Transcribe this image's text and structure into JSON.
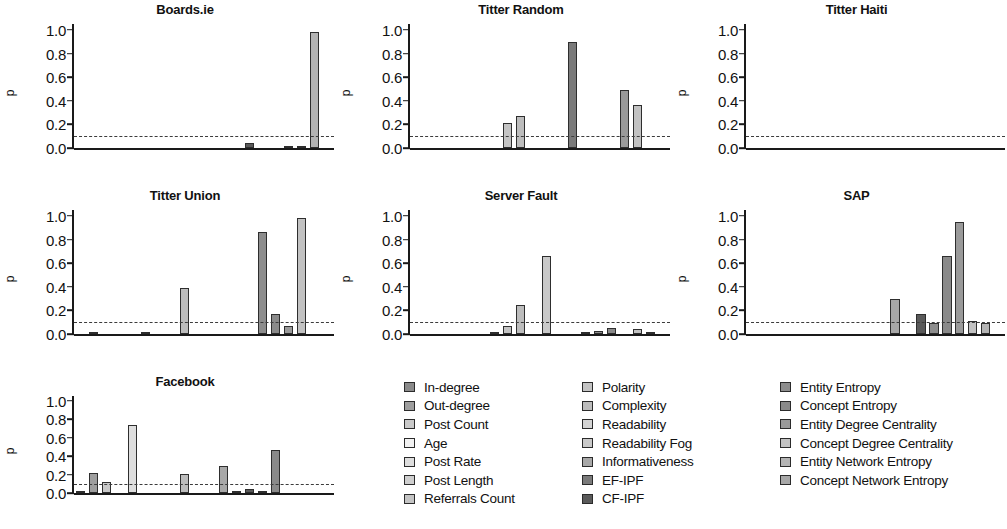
{
  "axis": {
    "ylabel": "p",
    "yticks": [
      "1.0",
      "0.8",
      "0.6",
      "0.4",
      "0.2",
      "0.0"
    ],
    "ylim": [
      0,
      1.05
    ],
    "threshold_value": 0.1
  },
  "legend": {
    "columns": [
      {
        "items": [
          {
            "label": "In-degree",
            "color": "#8a8a8a"
          },
          {
            "label": "Out-degree",
            "color": "#9e9e9e"
          },
          {
            "label": "Post Count",
            "color": "#c9c9c9"
          },
          {
            "label": "Age",
            "color": "#f2f2f2"
          },
          {
            "label": "Post Rate",
            "color": "#dedede"
          },
          {
            "label": "Post Length",
            "color": "#cfcfcf"
          },
          {
            "label": "Referrals Count",
            "color": "#c4c4c4"
          }
        ]
      },
      {
        "items": [
          {
            "label": "Polarity",
            "color": "#c4c4c4"
          },
          {
            "label": "Complexity",
            "color": "#bdbdbd"
          },
          {
            "label": "Readability",
            "color": "#d4d4d4"
          },
          {
            "label": "Readability Fog",
            "color": "#c9c9c9"
          },
          {
            "label": "Informativeness",
            "color": "#a8a8a8"
          },
          {
            "label": "EF-IPF",
            "color": "#7a7a7a"
          },
          {
            "label": "CF-IPF",
            "color": "#5a5a5a"
          }
        ]
      },
      {
        "items": [
          {
            "label": "Entity Entropy",
            "color": "#8d8d8d"
          },
          {
            "label": "Concept Entropy",
            "color": "#8a8a8a"
          },
          {
            "label": "Entity Degree Centrality",
            "color": "#9a9a9a"
          },
          {
            "label": "Concept Degree Centrality",
            "color": "#c2c2c2"
          },
          {
            "label": "Entity Network Entropy",
            "color": "#b4b4b4"
          },
          {
            "label": "Concept Network Entropy",
            "color": "#a8a8a8"
          }
        ]
      }
    ]
  },
  "chart_data": {
    "type": "bar",
    "title": "",
    "xlabel": "",
    "ylabel": "p",
    "ylim": [
      0,
      1.05
    ],
    "grid": false,
    "legend_position": "bottom",
    "threshold_line": {
      "value": 0.1,
      "style": "dashed",
      "label": "p = 0.1"
    },
    "categories": [
      "In-degree",
      "Out-degree",
      "Post Count",
      "Age",
      "Post Rate",
      "Post Length",
      "Referrals Count",
      "Polarity",
      "Complexity",
      "Readability",
      "Readability Fog",
      "Informativeness",
      "EF-IPF",
      "CF-IPF",
      "Entity Entropy",
      "Concept Entropy",
      "Entity Degree Centrality",
      "Concept Degree Centrality",
      "Entity Network Entropy",
      "Concept Network Entropy"
    ],
    "category_colors": [
      "#8a8a8a",
      "#9e9e9e",
      "#c9c9c9",
      "#f2f2f2",
      "#dedede",
      "#cfcfcf",
      "#c4c4c4",
      "#c4c4c4",
      "#bdbdbd",
      "#d4d4d4",
      "#c9c9c9",
      "#a8a8a8",
      "#7a7a7a",
      "#5a5a5a",
      "#8d8d8d",
      "#8a8a8a",
      "#9a9a9a",
      "#c2c2c2",
      "#b4b4b4",
      "#a8a8a8"
    ],
    "panels": [
      {
        "title": "Boards.ie",
        "values": [
          0,
          0,
          0,
          0,
          0,
          0,
          0,
          0,
          0,
          0,
          0,
          0,
          0,
          0.04,
          0,
          0,
          0.008,
          0.005,
          0.98,
          0
        ]
      },
      {
        "title": "Titter Random",
        "values": [
          0,
          0,
          0,
          0,
          0,
          0,
          0,
          0.21,
          0.27,
          0,
          0,
          0,
          0.9,
          0,
          0,
          0,
          0.49,
          0.365,
          0,
          0
        ]
      },
      {
        "title": "Titter Haiti",
        "values": [
          0,
          0,
          0,
          0,
          0,
          0,
          0,
          0,
          0,
          0,
          0,
          0,
          0,
          0,
          0,
          0,
          0,
          0,
          0,
          0
        ]
      },
      {
        "title": "Titter Union",
        "values": [
          0,
          0.01,
          0,
          0,
          0,
          0.005,
          0,
          0,
          0.39,
          0,
          0,
          0,
          0,
          0,
          0.86,
          0.17,
          0.07,
          0.98,
          0,
          0
        ]
      },
      {
        "title": "Server Fault",
        "values": [
          0,
          0,
          0,
          0,
          0,
          0,
          0.008,
          0.065,
          0.245,
          0,
          0.66,
          0,
          0,
          0.005,
          0.025,
          0.048,
          0,
          0.045,
          0.008,
          0
        ]
      },
      {
        "title": "SAP",
        "values": [
          0,
          0,
          0,
          0,
          0,
          0,
          0,
          0,
          0,
          0,
          0,
          0.3,
          0,
          0.17,
          0.09,
          0.66,
          0.95,
          0.11,
          0.09,
          0
        ]
      },
      {
        "title": "Facebook",
        "values": [
          0.008,
          0.22,
          0.12,
          0,
          0.74,
          0,
          0,
          0,
          0.21,
          0,
          0,
          0.295,
          0.015,
          0.04,
          0.02,
          0.47,
          0,
          0,
          0,
          0
        ]
      }
    ]
  }
}
